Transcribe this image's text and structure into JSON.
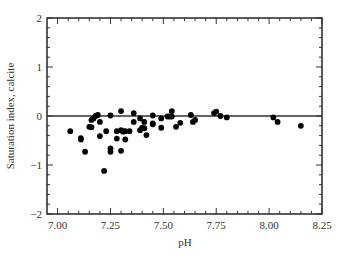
{
  "chart_data": {
    "type": "scatter",
    "title": "",
    "xlabel": "pH",
    "ylabel": "Saturation index, calcite",
    "xlim": [
      6.95,
      8.25
    ],
    "ylim": [
      -2,
      2
    ],
    "xticks": [
      7.0,
      7.25,
      7.5,
      7.75,
      8.0,
      8.25
    ],
    "xtick_labels": [
      "7.00",
      "7.25",
      "7.50",
      "7.75",
      "8.00",
      "8.25"
    ],
    "yticks": [
      -2,
      -1,
      0,
      1,
      2
    ],
    "ytick_labels": [
      "−2",
      "−1",
      "0",
      "1",
      "2"
    ],
    "grid": false,
    "legend": null,
    "reference_line": {
      "y": 0,
      "label": ""
    },
    "series": [
      {
        "name": "samples",
        "marker": "filled-circle",
        "color": "#000000",
        "points": [
          [
            7.06,
            -0.31
          ],
          [
            7.11,
            -0.45
          ],
          [
            7.11,
            -0.48
          ],
          [
            7.13,
            -0.73
          ],
          [
            7.15,
            -0.22
          ],
          [
            7.16,
            -0.23
          ],
          [
            7.16,
            -0.08
          ],
          [
            7.17,
            -0.05
          ],
          [
            7.18,
            0.0
          ],
          [
            7.19,
            0.02
          ],
          [
            7.2,
            -0.12
          ],
          [
            7.2,
            -0.41
          ],
          [
            7.22,
            -1.12
          ],
          [
            7.23,
            -0.31
          ],
          [
            7.25,
            0.01
          ],
          [
            7.25,
            -0.66
          ],
          [
            7.25,
            -0.73
          ],
          [
            7.28,
            -0.31
          ],
          [
            7.28,
            -0.46
          ],
          [
            7.3,
            0.1
          ],
          [
            7.3,
            -0.71
          ],
          [
            7.3,
            -0.29
          ],
          [
            7.31,
            -0.32
          ],
          [
            7.31,
            -0.31
          ],
          [
            7.32,
            -0.31
          ],
          [
            7.32,
            -0.48
          ],
          [
            7.34,
            -0.31
          ],
          [
            7.36,
            0.06
          ],
          [
            7.36,
            -0.12
          ],
          [
            7.39,
            -0.29
          ],
          [
            7.4,
            -0.24
          ],
          [
            7.41,
            -0.25
          ],
          [
            7.41,
            -0.12
          ],
          [
            7.42,
            -0.39
          ],
          [
            7.39,
            -0.05
          ],
          [
            7.45,
            0.01
          ],
          [
            7.45,
            -0.15
          ],
          [
            7.45,
            -0.17
          ],
          [
            7.49,
            -0.05
          ],
          [
            7.49,
            -0.24
          ],
          [
            7.52,
            -0.01
          ],
          [
            7.53,
            -0.01
          ],
          [
            7.54,
            -0.01
          ],
          [
            7.54,
            0.1
          ],
          [
            7.56,
            -0.22
          ],
          [
            7.58,
            -0.14
          ],
          [
            7.63,
            0.02
          ],
          [
            7.64,
            -0.12
          ],
          [
            7.65,
            -0.08
          ],
          [
            7.74,
            0.06
          ],
          [
            7.75,
            0.09
          ],
          [
            7.77,
            0.0
          ],
          [
            7.8,
            -0.03
          ],
          [
            8.02,
            -0.03
          ],
          [
            8.04,
            -0.12
          ],
          [
            8.15,
            -0.2
          ]
        ]
      }
    ]
  },
  "colors": {
    "axis": "#333333",
    "marker": "#000000",
    "background": "#ffffff"
  }
}
